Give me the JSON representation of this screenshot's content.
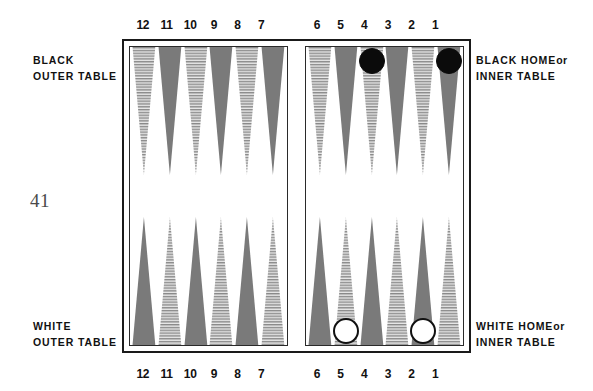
{
  "page": {
    "number": "41",
    "figure_type": "backgammon-board-diagram"
  },
  "captions": {
    "black_outer": {
      "line1": "BLACK",
      "line2": "OUTER TABLE"
    },
    "white_outer": {
      "line1": "WHITE",
      "line2": "OUTER TABLE"
    },
    "black_home": {
      "line1_main": "BLACK HOME",
      "line1_suffix": "or",
      "line2": "INNER TABLE"
    },
    "white_home": {
      "line1_main": "WHITE  HOME",
      "line1_suffix": "or",
      "line2": "INNER TABLE"
    }
  },
  "numbering": {
    "top_left": [
      "12",
      "11",
      "10",
      "9",
      "8",
      "7"
    ],
    "top_right": [
      "6",
      "5",
      "4",
      "3",
      "2",
      "1"
    ],
    "bottom_left": [
      "12",
      "11",
      "10",
      "9",
      "8",
      "7"
    ],
    "bottom_right": [
      "6",
      "5",
      "4",
      "3",
      "2",
      "1"
    ]
  },
  "colors": {
    "solid_point": "#7a7a7a",
    "striped_point_ink": "#8a8a8a",
    "striped_point_bg": "#e8e8e8",
    "black_checker": "#0b0b0b",
    "white_checker": "#ffffff",
    "frame": "#1a1a1a",
    "text": "#111111",
    "page_number": "#4a4a4a"
  },
  "board": {
    "quadrants": {
      "black_outer_top_left": {
        "label": "BLACK OUTER TABLE",
        "points": [
          {
            "number": "12",
            "fill": "striped",
            "checkers": 0,
            "checker_color": null
          },
          {
            "number": "11",
            "fill": "solid",
            "checkers": 0,
            "checker_color": null
          },
          {
            "number": "10",
            "fill": "striped",
            "checkers": 0,
            "checker_color": null
          },
          {
            "number": "9",
            "fill": "solid",
            "checkers": 0,
            "checker_color": null
          },
          {
            "number": "8",
            "fill": "striped",
            "checkers": 0,
            "checker_color": null
          },
          {
            "number": "7",
            "fill": "solid",
            "checkers": 0,
            "checker_color": null
          }
        ]
      },
      "black_home_top_right": {
        "label": "BLACK HOME or INNER TABLE",
        "points": [
          {
            "number": "6",
            "fill": "striped",
            "checkers": 0,
            "checker_color": null
          },
          {
            "number": "5",
            "fill": "solid",
            "checkers": 0,
            "checker_color": null
          },
          {
            "number": "4",
            "fill": "striped",
            "checkers": 1,
            "checker_color": "black"
          },
          {
            "number": "3",
            "fill": "solid",
            "checkers": 0,
            "checker_color": null
          },
          {
            "number": "2",
            "fill": "striped",
            "checkers": 0,
            "checker_color": null
          },
          {
            "number": "1",
            "fill": "solid",
            "checkers": 1,
            "checker_color": "black"
          }
        ]
      },
      "white_outer_bottom_left": {
        "label": "WHITE OUTER TABLE",
        "points": [
          {
            "number": "12",
            "fill": "solid",
            "checkers": 0,
            "checker_color": null
          },
          {
            "number": "11",
            "fill": "striped",
            "checkers": 0,
            "checker_color": null
          },
          {
            "number": "10",
            "fill": "solid",
            "checkers": 0,
            "checker_color": null
          },
          {
            "number": "9",
            "fill": "striped",
            "checkers": 0,
            "checker_color": null
          },
          {
            "number": "8",
            "fill": "solid",
            "checkers": 0,
            "checker_color": null
          },
          {
            "number": "7",
            "fill": "striped",
            "checkers": 0,
            "checker_color": null
          }
        ]
      },
      "white_home_bottom_right": {
        "label": "WHITE HOME or INNER TABLE",
        "points": [
          {
            "number": "6",
            "fill": "solid",
            "checkers": 0,
            "checker_color": null
          },
          {
            "number": "5",
            "fill": "striped",
            "checkers": 1,
            "checker_color": "white"
          },
          {
            "number": "4",
            "fill": "solid",
            "checkers": 0,
            "checker_color": null
          },
          {
            "number": "3",
            "fill": "striped",
            "checkers": 0,
            "checker_color": null
          },
          {
            "number": "2",
            "fill": "solid",
            "checkers": 1,
            "checker_color": "white"
          },
          {
            "number": "1",
            "fill": "striped",
            "checkers": 0,
            "checker_color": null
          }
        ]
      }
    }
  }
}
